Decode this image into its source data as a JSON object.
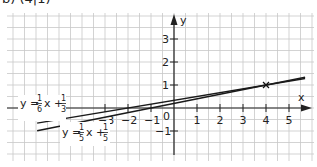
{
  "header": {
    "label": "b) (4|1)"
  },
  "chart_data": {
    "type": "line",
    "title": "",
    "xlabel": "x",
    "ylabel": "y",
    "xlim": [
      -7.3,
      6.1
    ],
    "ylim": [
      -2.3,
      4.1
    ],
    "x_ticks": [
      -3,
      -2,
      -1,
      1,
      2,
      3,
      4,
      5
    ],
    "y_ticks": [
      -1,
      1,
      2,
      3
    ],
    "origin_label": "0",
    "grid": true,
    "series": [
      {
        "name": "y = 1/6 x + 1/3",
        "slope": 0.16667,
        "intercept": 0.33333,
        "x": [
          -5.95,
          5.7
        ],
        "y": [
          -0.658,
          1.283
        ]
      },
      {
        "name": "y = 1/5 x + 1/5",
        "slope": 0.2,
        "intercept": 0.2,
        "x": [
          -5.95,
          5.7
        ],
        "y": [
          -0.99,
          1.34
        ]
      }
    ],
    "annotations": [
      {
        "type": "intersection-marker",
        "x": 4,
        "y": 1,
        "symbol": "×"
      }
    ],
    "equation_labels": [
      {
        "text_y": "y =",
        "num": "1",
        "den": "6",
        "mid": "x +",
        "num2": "1",
        "den2": "3"
      },
      {
        "text_y": "y =",
        "num": "1",
        "den": "5",
        "mid": "x +",
        "num2": "1",
        "den2": "5"
      }
    ]
  },
  "axes": {
    "x_label": "x",
    "y_label": "y",
    "origin": "0",
    "x_tick_labels": [
      "−3",
      "−2",
      "−1",
      "1",
      "2",
      "3",
      "4",
      "5"
    ],
    "y_tick_labels": [
      "3",
      "2",
      "1",
      "−1"
    ]
  },
  "colors": {
    "grid": "#c8c8c8",
    "axis": "#222222",
    "line": "#1a1a1a",
    "background": "#ffffff"
  }
}
